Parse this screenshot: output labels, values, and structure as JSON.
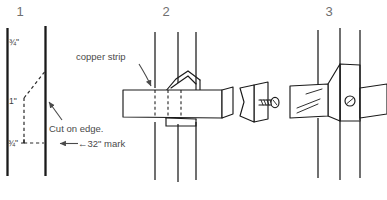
{
  "figure": {
    "background_color": "#ffffff",
    "ink_color": "#1a1a1a",
    "text_color": "#4a4a4a"
  },
  "panels": [
    {
      "number": "1",
      "caption_items": {
        "dim_top": "¾\"",
        "dim_middle": "1\"",
        "dim_bottom": "¾\"",
        "note_cut": "Cut on edge.",
        "note_mark": "←32\" mark"
      }
    },
    {
      "number": "2",
      "caption_items": {
        "label_strip": "copper strip"
      }
    },
    {
      "number": "3",
      "caption_items": {}
    }
  ],
  "annotations": {
    "copper_strip": "copper strip",
    "cut_on_edge": "Cut on edge.",
    "mark_32": "←32\" mark",
    "dim_three_quarter_top": "¾\"",
    "dim_one_inch": "1\"",
    "dim_three_quarter_bottom": "¾\""
  }
}
